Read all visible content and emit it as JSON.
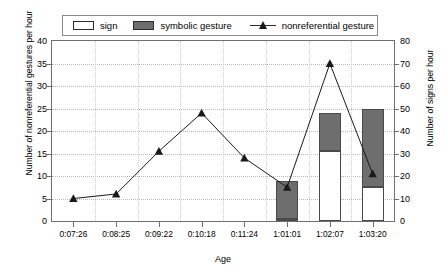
{
  "chart_data": {
    "type": "bar",
    "title": "",
    "xlabel": "Age",
    "ylabel": "Number of nonreferential gestures per hour",
    "ylabel_right": "Number of signs per hour",
    "categories": [
      "0:07:26",
      "0:08:25",
      "0:09:22",
      "0:10:18",
      "0:11:24",
      "1:01:01",
      "1:02:07",
      "1:03:20"
    ],
    "ylim": [
      0,
      40
    ],
    "yticks": [
      0,
      5,
      10,
      15,
      20,
      25,
      30,
      35,
      40
    ],
    "ylim_right": [
      0,
      80
    ],
    "yticks_right": [
      0,
      10,
      20,
      30,
      40,
      50,
      60,
      70,
      80
    ],
    "grid": true,
    "legend_position": "top",
    "stacked": true,
    "series": [
      {
        "name": "sign",
        "axis": "right",
        "kind": "bar-stack-bottom",
        "color": "#ffffff",
        "values": [
          0,
          0,
          0,
          0,
          0,
          1,
          31,
          15
        ]
      },
      {
        "name": "symbolic gesture",
        "axis": "right",
        "kind": "bar-stack-top",
        "color": "#6e6e6e",
        "values": [
          0,
          0,
          0,
          0,
          0,
          17,
          17,
          35
        ]
      },
      {
        "name": "nonreferential gesture",
        "axis": "left",
        "kind": "line",
        "color": "#1a1a1a",
        "marker": "triangle",
        "values": [
          5,
          6,
          15.5,
          24,
          14,
          7.5,
          35,
          10.5
        ]
      }
    ]
  },
  "legend": {
    "entries": [
      {
        "label": "sign",
        "icon": "white-square-swatch"
      },
      {
        "label": "symbolic gesture",
        "icon": "gray-square-swatch"
      },
      {
        "label": "nonreferential gesture",
        "icon": "line-triangle-marker"
      }
    ]
  },
  "axes": {
    "left_title": "Number of nonreferential gestures per hour",
    "right_title": "Number of signs per hour",
    "x_title": "Age",
    "left_ticks": [
      "0",
      "5",
      "10",
      "15",
      "20",
      "25",
      "30",
      "35",
      "40"
    ],
    "right_ticks": [
      "0",
      "10",
      "20",
      "30",
      "40",
      "50",
      "60",
      "70",
      "80"
    ],
    "x_ticks": [
      "0:07:26",
      "0:08:25",
      "0:09:22",
      "0:10:18",
      "0:11:24",
      "1:01:01",
      "1:02:07",
      "1:03:20"
    ]
  },
  "colors": {
    "bar_symbolic": "#6e6e6e",
    "bar_sign": "#ffffff",
    "line": "#1a1a1a",
    "grid": "#b9b9b9",
    "axis": "#6f6f6f"
  }
}
